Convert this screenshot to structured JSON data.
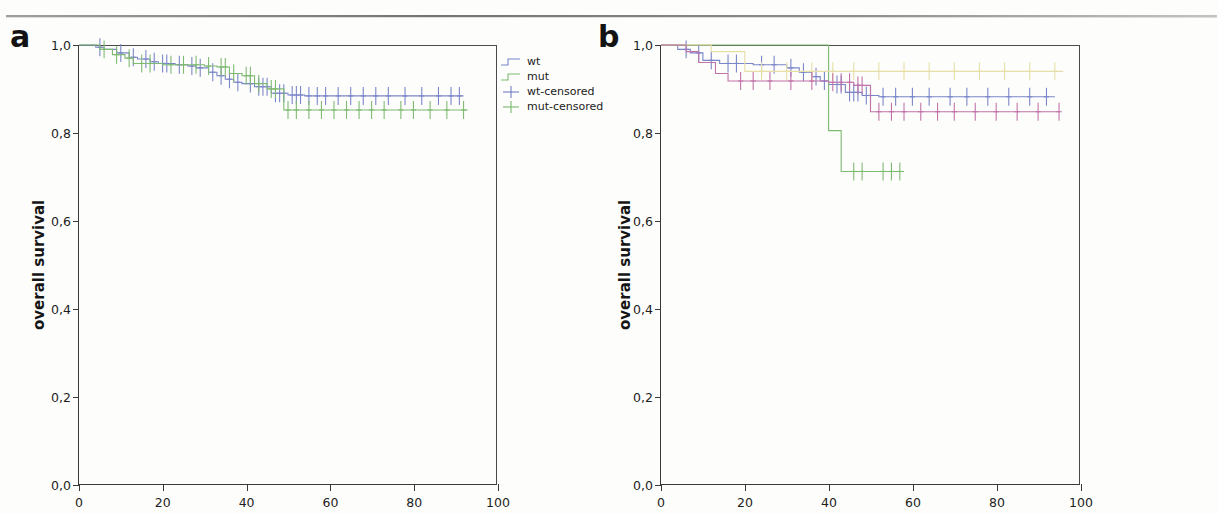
{
  "figure": {
    "panels": [
      {
        "id": "a",
        "letter": "a",
        "y_axis_title": "overall survival",
        "y_ticks": [
          "1,0",
          "0,8",
          "0,6",
          "0,4",
          "0,2",
          "0,0"
        ],
        "x_ticks": [
          "0",
          "20",
          "40",
          "60",
          "80",
          "100"
        ],
        "legend": [
          {
            "label": "wt",
            "color": "#7b86c8",
            "key": "step"
          },
          {
            "label": "mut",
            "color": "#7fba72",
            "key": "step"
          },
          {
            "label": "wt-censored",
            "color": "#6f7ec4",
            "key": "plus"
          },
          {
            "label": "mut-censored",
            "color": "#78b96c",
            "key": "plus"
          }
        ]
      },
      {
        "id": "b",
        "letter": "b",
        "y_axis_title": "overall survival",
        "y_ticks": [
          "1,0",
          "0,8",
          "0,6",
          "0,4",
          "0,2",
          "0,0"
        ],
        "x_ticks": [
          "0",
          "20",
          "40",
          "60",
          "80",
          "100"
        ],
        "legend": [
          {
            "label": "wt",
            "color": "#7b86c8",
            "key": "step"
          },
          {
            "label": "other exons",
            "color": "#7fba72",
            "key": "step"
          },
          {
            "label": "exon 9",
            "color": "#e6dfa6",
            "key": "step"
          },
          {
            "label": "exon 20",
            "color": "#c173a8",
            "key": "step"
          },
          {
            "label": "wt censored",
            "color": "#6f7ec4",
            "key": "plus"
          },
          {
            "label": "other exons censored",
            "color": "#5faa55",
            "key": "plus"
          },
          {
            "label": "exon 9 censored",
            "color": "#e3d9a0",
            "key": "plus"
          },
          {
            "label": "exon 20 censored",
            "color": "#c46ba2",
            "key": "plus"
          }
        ]
      }
    ]
  },
  "chart_data": [
    {
      "type": "line",
      "subtype": "kaplan-meier-step",
      "panel": "a",
      "title": "",
      "xlabel": "",
      "ylabel": "overall survival",
      "xlim": [
        0,
        100
      ],
      "ylim": [
        0.0,
        1.0
      ],
      "xticks": [
        0,
        20,
        40,
        60,
        80,
        100
      ],
      "yticks": [
        0.0,
        0.2,
        0.4,
        0.6,
        0.8,
        1.0
      ],
      "grid": false,
      "legend_position": "right",
      "decimal_separator": ",",
      "series": [
        {
          "name": "wt",
          "color": "#7b86c8",
          "steps": [
            [
              0,
              1.0
            ],
            [
              4,
              0.995
            ],
            [
              6,
              0.99
            ],
            [
              9,
              0.982
            ],
            [
              12,
              0.972
            ],
            [
              14,
              0.968
            ],
            [
              17,
              0.962
            ],
            [
              19,
              0.958
            ],
            [
              23,
              0.955
            ],
            [
              26,
              0.952
            ],
            [
              28,
              0.948
            ],
            [
              31,
              0.938
            ],
            [
              33,
              0.93
            ],
            [
              35,
              0.922
            ],
            [
              37,
              0.915
            ],
            [
              39,
              0.912
            ],
            [
              42,
              0.905
            ],
            [
              46,
              0.89
            ],
            [
              50,
              0.886
            ],
            [
              54,
              0.884
            ],
            [
              92,
              0.884
            ]
          ],
          "censored": [
            [
              5,
              0.995
            ],
            [
              10,
              0.982
            ],
            [
              13,
              0.972
            ],
            [
              16,
              0.968
            ],
            [
              18,
              0.962
            ],
            [
              20,
              0.958
            ],
            [
              21,
              0.958
            ],
            [
              24,
              0.955
            ],
            [
              27,
              0.952
            ],
            [
              29,
              0.948
            ],
            [
              32,
              0.938
            ],
            [
              34,
              0.93
            ],
            [
              36,
              0.922
            ],
            [
              38,
              0.915
            ],
            [
              41,
              0.912
            ],
            [
              43,
              0.905
            ],
            [
              44,
              0.905
            ],
            [
              45,
              0.905
            ],
            [
              47,
              0.89
            ],
            [
              48,
              0.89
            ],
            [
              49,
              0.89
            ],
            [
              51,
              0.886
            ],
            [
              52,
              0.886
            ],
            [
              53,
              0.886
            ],
            [
              55,
              0.884
            ],
            [
              57,
              0.884
            ],
            [
              59,
              0.884
            ],
            [
              62,
              0.884
            ],
            [
              65,
              0.884
            ],
            [
              68,
              0.884
            ],
            [
              71,
              0.884
            ],
            [
              74,
              0.884
            ],
            [
              78,
              0.884
            ],
            [
              82,
              0.884
            ],
            [
              86,
              0.884
            ],
            [
              89,
              0.884
            ],
            [
              91,
              0.884
            ]
          ]
        },
        {
          "name": "mut",
          "color": "#7fba72",
          "steps": [
            [
              0,
              1.0
            ],
            [
              5,
              0.99
            ],
            [
              8,
              0.978
            ],
            [
              11,
              0.97
            ],
            [
              13,
              0.958
            ],
            [
              20,
              0.955
            ],
            [
              26,
              0.955
            ],
            [
              30,
              0.952
            ],
            [
              33,
              0.95
            ],
            [
              36,
              0.935
            ],
            [
              39,
              0.93
            ],
            [
              42,
              0.912
            ],
            [
              45,
              0.9
            ],
            [
              49,
              0.852
            ],
            [
              93,
              0.852
            ]
          ],
          "censored": [
            [
              6,
              0.99
            ],
            [
              9,
              0.978
            ],
            [
              12,
              0.97
            ],
            [
              15,
              0.958
            ],
            [
              17,
              0.958
            ],
            [
              22,
              0.955
            ],
            [
              25,
              0.955
            ],
            [
              28,
              0.955
            ],
            [
              31,
              0.952
            ],
            [
              34,
              0.95
            ],
            [
              35,
              0.95
            ],
            [
              37,
              0.935
            ],
            [
              40,
              0.93
            ],
            [
              41,
              0.93
            ],
            [
              43,
              0.912
            ],
            [
              46,
              0.9
            ],
            [
              47,
              0.9
            ],
            [
              50,
              0.852
            ],
            [
              52,
              0.852
            ],
            [
              55,
              0.852
            ],
            [
              58,
              0.852
            ],
            [
              61,
              0.852
            ],
            [
              64,
              0.852
            ],
            [
              67,
              0.852
            ],
            [
              70,
              0.852
            ],
            [
              73,
              0.852
            ],
            [
              77,
              0.852
            ],
            [
              80,
              0.852
            ],
            [
              84,
              0.852
            ],
            [
              88,
              0.852
            ],
            [
              92,
              0.852
            ]
          ]
        }
      ]
    },
    {
      "type": "line",
      "subtype": "kaplan-meier-step",
      "panel": "b",
      "title": "",
      "xlabel": "",
      "ylabel": "overall survival",
      "xlim": [
        0,
        100
      ],
      "ylim": [
        0.0,
        1.0
      ],
      "xticks": [
        0,
        20,
        40,
        60,
        80,
        100
      ],
      "yticks": [
        0.0,
        0.2,
        0.4,
        0.6,
        0.8,
        1.0
      ],
      "grid": false,
      "legend_position": "right",
      "decimal_separator": ",",
      "series": [
        {
          "name": "wt",
          "color": "#7b86c8",
          "steps": [
            [
              0,
              1.0
            ],
            [
              4,
              0.99
            ],
            [
              7,
              0.982
            ],
            [
              10,
              0.965
            ],
            [
              14,
              0.958
            ],
            [
              22,
              0.955
            ],
            [
              30,
              0.948
            ],
            [
              33,
              0.938
            ],
            [
              36,
              0.928
            ],
            [
              38,
              0.918
            ],
            [
              40,
              0.91
            ],
            [
              44,
              0.892
            ],
            [
              48,
              0.885
            ],
            [
              52,
              0.882
            ],
            [
              94,
              0.882
            ]
          ],
          "censored": [
            [
              6,
              0.99
            ],
            [
              9,
              0.982
            ],
            [
              12,
              0.965
            ],
            [
              16,
              0.958
            ],
            [
              18,
              0.958
            ],
            [
              24,
              0.955
            ],
            [
              27,
              0.955
            ],
            [
              31,
              0.948
            ],
            [
              34,
              0.938
            ],
            [
              37,
              0.928
            ],
            [
              39,
              0.918
            ],
            [
              42,
              0.91
            ],
            [
              43,
              0.91
            ],
            [
              45,
              0.892
            ],
            [
              46,
              0.892
            ],
            [
              47,
              0.892
            ],
            [
              49,
              0.885
            ],
            [
              50,
              0.885
            ],
            [
              53,
              0.882
            ],
            [
              56,
              0.882
            ],
            [
              60,
              0.882
            ],
            [
              64,
              0.882
            ],
            [
              69,
              0.882
            ],
            [
              73,
              0.882
            ],
            [
              78,
              0.882
            ],
            [
              83,
              0.882
            ],
            [
              88,
              0.882
            ],
            [
              92,
              0.882
            ]
          ]
        },
        {
          "name": "other exons",
          "color": "#7fba72",
          "steps": [
            [
              0,
              1.0
            ],
            [
              40,
              1.0
            ],
            [
              40,
              0.805
            ],
            [
              43,
              0.712
            ],
            [
              58,
              0.712
            ]
          ],
          "censored": [
            [
              46,
              0.712
            ],
            [
              48,
              0.712
            ],
            [
              53,
              0.712
            ],
            [
              55,
              0.712
            ],
            [
              57,
              0.712
            ]
          ]
        },
        {
          "name": "exon 9",
          "color": "#e6dfa6",
          "steps": [
            [
              0,
              1.0
            ],
            [
              12,
              0.985
            ],
            [
              20,
              0.94
            ],
            [
              96,
              0.94
            ]
          ],
          "censored": [
            [
              24,
              0.94
            ],
            [
              30,
              0.94
            ],
            [
              36,
              0.94
            ],
            [
              41,
              0.94
            ],
            [
              46,
              0.94
            ],
            [
              52,
              0.94
            ],
            [
              58,
              0.94
            ],
            [
              64,
              0.94
            ],
            [
              70,
              0.94
            ],
            [
              76,
              0.94
            ],
            [
              82,
              0.94
            ],
            [
              88,
              0.94
            ],
            [
              94,
              0.94
            ]
          ]
        },
        {
          "name": "exon 20",
          "color": "#c173a8",
          "steps": [
            [
              0,
              1.0
            ],
            [
              6,
              0.985
            ],
            [
              9,
              0.96
            ],
            [
              13,
              0.935
            ],
            [
              16,
              0.918
            ],
            [
              40,
              0.915
            ],
            [
              46,
              0.908
            ],
            [
              50,
              0.848
            ],
            [
              95,
              0.848
            ]
          ],
          "censored": [
            [
              19,
              0.918
            ],
            [
              22,
              0.918
            ],
            [
              26,
              0.918
            ],
            [
              31,
              0.918
            ],
            [
              36,
              0.918
            ],
            [
              41,
              0.915
            ],
            [
              43,
              0.915
            ],
            [
              45,
              0.915
            ],
            [
              47,
              0.908
            ],
            [
              48,
              0.908
            ],
            [
              52,
              0.848
            ],
            [
              55,
              0.848
            ],
            [
              58,
              0.848
            ],
            [
              62,
              0.848
            ],
            [
              66,
              0.848
            ],
            [
              70,
              0.848
            ],
            [
              75,
              0.848
            ],
            [
              80,
              0.848
            ],
            [
              85,
              0.848
            ],
            [
              90,
              0.848
            ],
            [
              95,
              0.848
            ]
          ]
        }
      ]
    }
  ]
}
